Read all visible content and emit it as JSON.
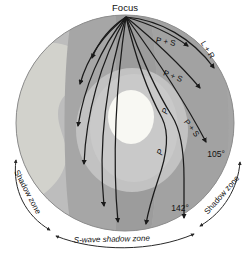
{
  "figure": {
    "background_color": "#ffffff"
  },
  "source_point": {
    "label": "Focus",
    "name": "earthquake-focus"
  },
  "earth": {
    "layers": [
      {
        "name": "mantle-light",
        "label": "mantle",
        "color": "#b9b9b9"
      },
      {
        "name": "mantle-mid",
        "label": "mantle",
        "color": "#a8a8a8"
      },
      {
        "name": "mantle-dark",
        "label": "mantle",
        "color": "#9a9a9a"
      },
      {
        "name": "outer-core",
        "label": "outer core",
        "color": "#c6c6c6"
      },
      {
        "name": "inner-core",
        "label": "inner core",
        "color": "#f7f7f2"
      }
    ],
    "surface_color": "#b0b0b0",
    "continent_color": "#d2d2cc",
    "continent_name": "south-america"
  },
  "wave_labels": {
    "surface_waves": "L + R",
    "body_waves_upper": "P + S",
    "body_waves_mid": "P + S",
    "body_waves_lower": "P + S",
    "p_wave_inner": "P",
    "p_wave_outer": "P"
  },
  "angles": {
    "p_shadow_start": "105°",
    "p_shadow_end": "142°"
  },
  "zones": {
    "left_shadow": "Shadow zone",
    "right_shadow": "Shadow zone",
    "s_wave_shadow": "S-wave shadow zone"
  },
  "colors": {
    "ray": "#1a1a1a",
    "text": "#111111",
    "arc": "#2a2a2a"
  }
}
